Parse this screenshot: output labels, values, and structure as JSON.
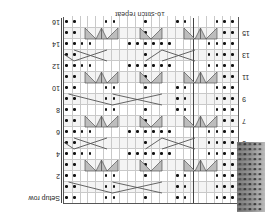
{
  "figure": {
    "type": "knitting-chart",
    "orientation": "rotated-180",
    "repeat_label": "16-stitch repeat",
    "setup_row_label": "Setup row",
    "stitch_repeat_count": 16,
    "columns": 16,
    "rows_total": 17,
    "swatch_alt": "knitted-swatch-photo"
  },
  "row_numbers": {
    "left_odd": [
      "1",
      "3",
      "5",
      "7",
      "9",
      "11",
      "13",
      "15"
    ],
    "right_even": [
      "2",
      "4",
      "6",
      "8",
      "10",
      "12",
      "14",
      "16"
    ]
  },
  "colors": {
    "grid_line": "#c9c9c9",
    "heavy_line": "#6a6a6a",
    "border": "#555555",
    "symbol": "#555555",
    "shade": "#f4f4f4",
    "dot": "#111111",
    "text": "#222222"
  },
  "chart_data": {
    "type": "table",
    "title": "16-stitch repeat",
    "xlabel": "",
    "ylabel": "",
    "legend": [
      "purl",
      "cable-cross",
      "decrease"
    ],
    "categories": [
      "col1",
      "col2",
      "col3",
      "col4",
      "col5",
      "col6",
      "col7",
      "col8",
      "col9",
      "col10",
      "col11",
      "col12",
      "col13",
      "col14",
      "col15",
      "col16"
    ],
    "row_labels": [
      "Setup row",
      "1",
      "2",
      "3",
      "4",
      "5",
      "6",
      "7",
      "8",
      "9",
      "10",
      "11",
      "12",
      "13",
      "14",
      "15",
      "16"
    ],
    "symbols_key": {
      ".": "purl stitch (dot)",
      " ": "knit stitch (blank)",
      "X": "cable cross (4-st)",
      "/": "right-leaning decrease",
      "\\": "left-leaning decrease",
      "V": "double decrease"
    },
    "grid": [
      ". . .   . .   .   . .   . . .",
      ". . .   . . X X X X . .   . . .",
      ". . .   . .   .   . .   . . .",
      ". . / V \\   / \\   / V \\ . . .",
      ". . . .   . . . .   . . . . .",
      ". . . . X X X . . . X X X . . .",
      ". . . .   . . . .   . . . . .",
      ". . / V \\   / \\   / V \\ . . .",
      ". . .   . .   .   . .   . . .",
      ". . .   . . X X X X . .   . . .",
      ". . .   . .   .   . .   . . .",
      ". . / V \\   / \\   / V \\ . . .",
      ". . . .   . . . .   . . . . .",
      ". . . . X X X . . . X X X . . .",
      ". . . .   . . . .   . . . . .",
      ". . / V \\   / \\   / V \\ . . .",
      ". . .   . .   .   . .   . . ."
    ],
    "purl_columns_by_row": [
      [
        0,
        1,
        2,
        6,
        7,
        11,
        15,
        16,
        20,
        21
      ],
      [
        0,
        1,
        2,
        6,
        7,
        15,
        16,
        20,
        21
      ],
      [
        0,
        1,
        2,
        6,
        7,
        11,
        15,
        16,
        20,
        21
      ],
      [
        0,
        1,
        11,
        20,
        21
      ],
      [
        0,
        1,
        2,
        3,
        8,
        9,
        10,
        11,
        12,
        13,
        18,
        19,
        20,
        21
      ],
      [
        0,
        1,
        2,
        3,
        11,
        20,
        21
      ],
      [
        0,
        1,
        2,
        3,
        8,
        9,
        10,
        11,
        12,
        13,
        18,
        19,
        20,
        21
      ],
      [
        0,
        1,
        11,
        20,
        21
      ],
      [
        0,
        1,
        2,
        6,
        7,
        11,
        15,
        16,
        20,
        21
      ],
      [
        0,
        1,
        2,
        6,
        7,
        15,
        16,
        20,
        21
      ],
      [
        0,
        1,
        2,
        6,
        7,
        11,
        15,
        16,
        20,
        21
      ],
      [
        0,
        1,
        11,
        20,
        21
      ],
      [
        0,
        1,
        2,
        3,
        8,
        9,
        10,
        11,
        12,
        13,
        18,
        19,
        20,
        21
      ],
      [
        0,
        1,
        2,
        3,
        11,
        20,
        21
      ],
      [
        0,
        1,
        2,
        3,
        8,
        9,
        10,
        11,
        12,
        13,
        18,
        19,
        20,
        21
      ],
      [
        0,
        1,
        11,
        20,
        21
      ],
      [
        0,
        1,
        2,
        6,
        7,
        11,
        15,
        16,
        20,
        21
      ]
    ]
  }
}
